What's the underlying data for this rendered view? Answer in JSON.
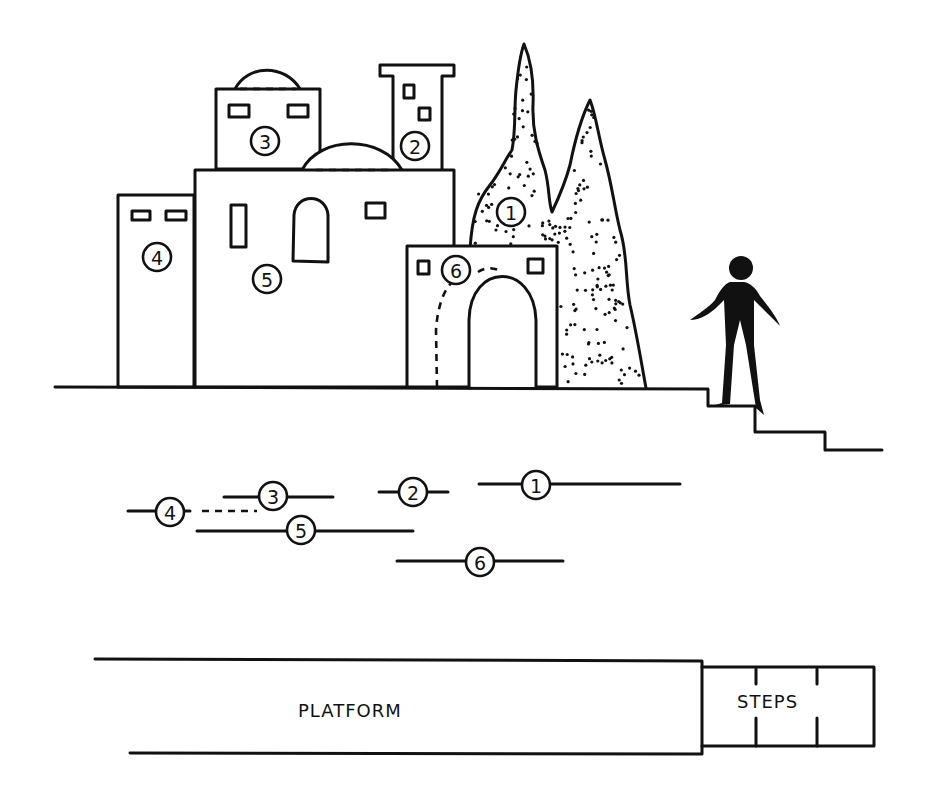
{
  "diagram": {
    "elevation": {
      "pieces": [
        {
          "id": "1",
          "label": "1",
          "name": "cypress trees"
        },
        {
          "id": "2",
          "label": "2",
          "name": "tower"
        },
        {
          "id": "3",
          "label": "3",
          "name": "domed upper house"
        },
        {
          "id": "4",
          "label": "4",
          "name": "left house"
        },
        {
          "id": "5",
          "label": "5",
          "name": "main domed house"
        },
        {
          "id": "6",
          "label": "6",
          "name": "archway gate"
        }
      ]
    },
    "ground_plan": {
      "markers": [
        {
          "label": "4"
        },
        {
          "label": "3"
        },
        {
          "label": "2"
        },
        {
          "label": "1"
        },
        {
          "label": "5"
        },
        {
          "label": "6"
        }
      ]
    },
    "floor_plan": {
      "platform_label": "PLATFORM",
      "steps_label": "STEPS"
    },
    "colors": {
      "ink": "#111111",
      "paper": "#ffffff"
    }
  }
}
